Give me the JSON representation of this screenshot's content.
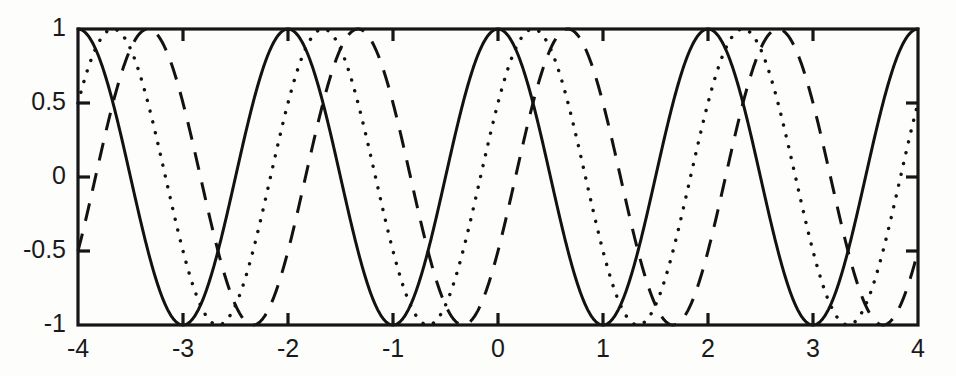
{
  "chart_data": {
    "type": "line",
    "title": "",
    "subtitle": "",
    "xlabel": "",
    "ylabel": "",
    "xlim": [
      -4,
      4
    ],
    "ylim": [
      -1,
      1
    ],
    "xticks": [
      -4,
      -3,
      -2,
      -1,
      0,
      1,
      2,
      3,
      4
    ],
    "xtick_labels": [
      "-4",
      "-3",
      "-2",
      "-1",
      "0",
      "1",
      "2",
      "3",
      "4"
    ],
    "yticks": [
      -1,
      -0.5,
      0,
      0.5,
      1
    ],
    "ytick_labels": [
      "-1",
      "-0.5",
      "0",
      "0.5",
      "1"
    ],
    "grid": false,
    "legend": "none",
    "frame": "box",
    "series": [
      {
        "name": "cos(pi*x)",
        "style": "solid",
        "color": "#121212",
        "amplitude": 1,
        "period": 2,
        "phase_shift": 0,
        "description": "Solid sinusoid with maxima at x = -4, -2, 0, 2, 4 and minima at x = -3, -1, 1, 3"
      },
      {
        "name": "cos(pi*(x - 1/3))",
        "style": "dotted",
        "color": "#121212",
        "amplitude": 1,
        "period": 2,
        "phase_shift": 0.3333,
        "description": "Dotted sinusoid shifted right by one third unit; maxima near x = -3.67, -1.67, 0.33, 2.33"
      },
      {
        "name": "cos(pi*(x - 2/3))",
        "style": "dashed",
        "color": "#121212",
        "amplitude": 1,
        "period": 2,
        "phase_shift": 0.6667,
        "description": "Dashed sinusoid shifted right by two thirds unit; maxima near x = -3.33, -1.33, 0.67, 2.67"
      }
    ],
    "endpoint_values": {
      "x_min": {
        "solid": 1.0,
        "dotted": 0.5,
        "dashed": -0.5
      },
      "x_max": {
        "solid": 1.0,
        "dotted": 0.5,
        "dashed": -0.5
      }
    }
  },
  "figure": {
    "background_color": "#fdfdfc",
    "line_color": "#121212",
    "axis_color": "#161616"
  }
}
